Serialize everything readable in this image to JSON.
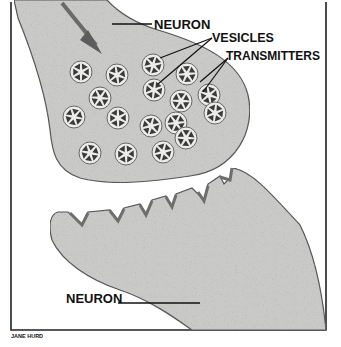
{
  "labels": {
    "neuron_top": "NEURON",
    "vesicles": "VESICLES",
    "transmitters": "TRANSMITTERS",
    "neuron_bottom": "NEURON",
    "credit": "JANE HURD"
  },
  "colors": {
    "neuron_fill": "#c9c9c7",
    "outline": "#555555",
    "frame": "#222222",
    "vesicle_fill": "#ececea",
    "transmitter": "#3a3a3a"
  },
  "vesicle_count": 17
}
